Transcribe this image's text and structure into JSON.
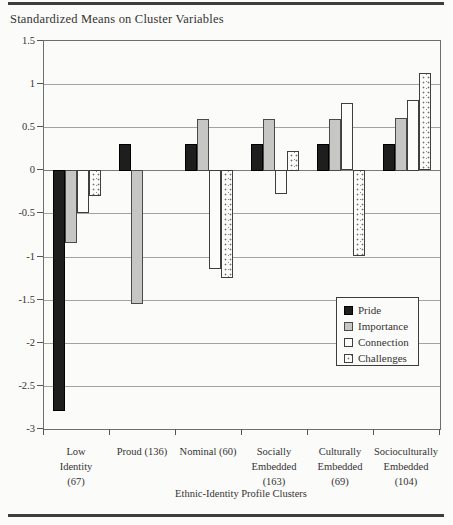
{
  "figure": {
    "title": "Standardized Means on Cluster Variables",
    "xaxis_title": "Ethnic-Identity Profile Clusters"
  },
  "chart_data": {
    "type": "bar",
    "title": "Standardized Means on Cluster Variables",
    "xlabel": "Ethnic-Identity Profile Clusters",
    "ylabel": "",
    "ylim": [
      -3,
      1.5
    ],
    "ytick_step": 0.5,
    "ytick_labels": [
      "1.5",
      "1",
      "0.5",
      "0",
      "-0.5",
      "-1",
      "-1.5",
      "-2",
      "-2.5",
      "-3"
    ],
    "ytick_values": [
      1.5,
      1,
      0.5,
      0,
      -0.5,
      -1,
      -1.5,
      -2,
      -2.5,
      -3
    ],
    "grid": true,
    "legend_position": "inside-lower-right",
    "categories": [
      {
        "name": "low-identity",
        "label_lines": [
          "Low",
          "Identity",
          "(67)"
        ]
      },
      {
        "name": "proud",
        "label_lines": [
          "Proud (136)"
        ]
      },
      {
        "name": "nominal",
        "label_lines": [
          "Nominal (60)"
        ]
      },
      {
        "name": "socially-embedded",
        "label_lines": [
          "Socially",
          "Embedded",
          "(163)"
        ]
      },
      {
        "name": "culturally-embedded",
        "label_lines": [
          "Culturally",
          "Embedded",
          "(69)"
        ]
      },
      {
        "name": "socioculturally-embedded",
        "label_lines": [
          "Socioculturally",
          "Embedded",
          "(104)"
        ]
      }
    ],
    "series": [
      {
        "name": "Pride",
        "key": "pride",
        "color": "#1e1e1e",
        "values": [
          -2.8,
          0.31,
          0.31,
          0.31,
          0.31,
          0.31
        ]
      },
      {
        "name": "Importance",
        "key": "importance",
        "color": "#c6c6c4",
        "values": [
          -0.85,
          -1.55,
          0.6,
          0.6,
          0.6,
          0.61
        ]
      },
      {
        "name": "Connection",
        "key": "connection",
        "color": "#fcfcfa",
        "values": [
          -0.5,
          0,
          -1.15,
          -0.28,
          0.78,
          0.82
        ]
      },
      {
        "name": "Challenges",
        "key": "challenges",
        "color": "#fcfcfa",
        "values": [
          -0.3,
          0,
          -1.25,
          0.23,
          -1.0,
          1.13
        ]
      }
    ]
  }
}
